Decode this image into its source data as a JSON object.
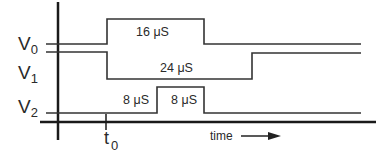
{
  "diagram": {
    "signals": [
      {
        "name": "V",
        "sub": "0",
        "pulse_label": "16 μS"
      },
      {
        "name": "V",
        "sub": "1",
        "pulse_label": "24 μS"
      },
      {
        "name": "V",
        "sub": "2",
        "pulse_labels": [
          "8 μS",
          "8 μS"
        ]
      }
    ],
    "t0_label": {
      "base": "t",
      "sub": "0"
    },
    "time_axis_label": "time",
    "line_color": "#333333"
  }
}
